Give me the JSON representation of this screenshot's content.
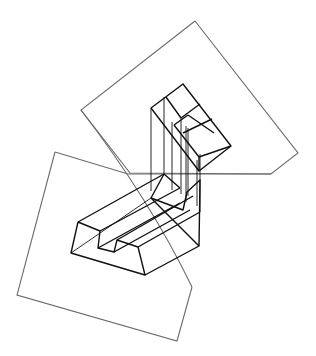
{
  "figure": {
    "colors": {
      "plane_stroke": "#6a6a6a",
      "object_stroke": "#111111",
      "background": "#ffffff"
    },
    "planes": [
      {
        "name": "upper-plane",
        "points": "195,21 81,110 130,173 271,174 298,153 195,21"
      },
      {
        "name": "lower-plane",
        "points": "55,152 17,295 177,341 192,287"
      },
      {
        "name": "fold-line",
        "points": "55,152 128,174 271,174"
      },
      {
        "name": "diagonal-curve",
        "d": "M81,110 Q150,200 192,287"
      }
    ],
    "top_block": {
      "outer": "151,108 183,84 231,146 199,171 151,108",
      "inner_lines": [
        "166,97 181,118",
        "181,118 200,104",
        "174,125 188,115",
        "188,115 214,133",
        "174,125 199,157",
        "199,157 231,146",
        "183,133 212,119",
        "199,157 199,171"
      ]
    },
    "projection_lines": [
      "151,108 151,191",
      "164,97 164,174",
      "172,122 172,190",
      "181,118 181,194",
      "186,126 186,202",
      "188,128 188,196",
      "197,160 197,206",
      "200,154 200,212"
    ],
    "bottom_block": {
      "front_profile": "78,222 71,253 145,275 138,247 117,240 114,252 98,248 100,231 78,222",
      "back_profile": "164,174 151,198 183,210 187,192 200,180 199,246 145,275",
      "edges": [
        "78,222 164,174",
        "100,231 180,188",
        "98,248 180,203",
        "114,252 190,210",
        "117,240 193,196",
        "138,247 200,212",
        "71,253 151,198",
        "164,174 180,188",
        "151,198 199,246"
      ]
    }
  }
}
